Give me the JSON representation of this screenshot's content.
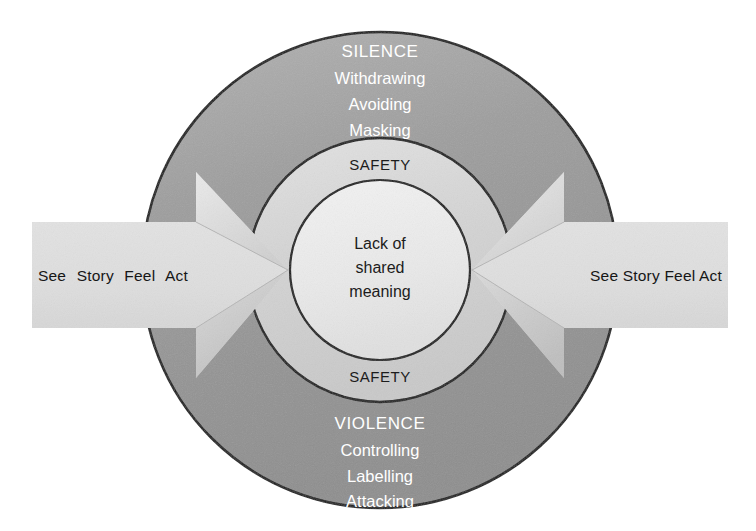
{
  "canvas": {
    "width": 756,
    "height": 531,
    "background": "#ffffff"
  },
  "palette": {
    "outer_ring": "#9a9a9a",
    "middle_ring": "#d2d2d2",
    "inner_circle": "#ececec",
    "arrow_fill": "#d8d8d8",
    "arrow_fill_light": "#e6e6e6",
    "arrow_fill_shade": "#c6c6c6",
    "stroke": "#1a1a1a",
    "text_light": "#ffffff",
    "text_dark": "#1c1c1c"
  },
  "diagram": {
    "outer_ring": {
      "top_group": {
        "heading": "SILENCE",
        "items": [
          "Withdrawing",
          "Avoiding",
          "Masking"
        ]
      },
      "bottom_group": {
        "heading": "VIOLENCE",
        "items": [
          "Controlling",
          "Labelling",
          "Attacking"
        ]
      }
    },
    "middle_ring": {
      "top_label": "SAFETY",
      "bottom_label": "SAFETY"
    },
    "center": {
      "lines": [
        "Lack of",
        "shared",
        "meaning"
      ]
    },
    "arrows": [
      {
        "id": "left",
        "direction": "right",
        "label": "See Story Feel Act"
      },
      {
        "id": "right",
        "direction": "left",
        "label": "See Story Feel Act"
      }
    ]
  }
}
